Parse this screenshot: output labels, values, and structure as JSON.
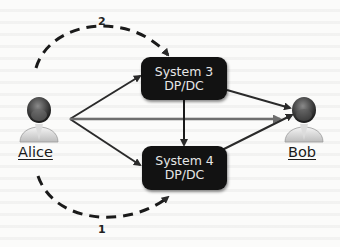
{
  "diagram": {
    "nodes": {
      "alice": {
        "label": "Alice",
        "icon": "user-avatar-icon"
      },
      "bob": {
        "label": "Bob",
        "icon": "user-avatar-icon"
      },
      "system3": {
        "line1": "System 3",
        "line2": "DP/DC"
      },
      "system4": {
        "line1": "System 4",
        "line2": "DP/DC"
      }
    },
    "paths": {
      "dashed_top_label": "2",
      "dashed_bottom_label": "1"
    },
    "edges": [
      {
        "from": "Alice",
        "to": "System 3",
        "style": "solid"
      },
      {
        "from": "Alice",
        "to": "System 4",
        "style": "solid"
      },
      {
        "from": "Alice",
        "to": "Bob",
        "style": "solid"
      },
      {
        "from": "System 3",
        "to": "System 4",
        "style": "solid"
      },
      {
        "from": "System 3",
        "to": "Bob",
        "style": "solid"
      },
      {
        "from": "System 4",
        "to": "Bob",
        "style": "solid"
      },
      {
        "from": "Alice",
        "to": "System 3",
        "style": "dashed",
        "label": "2"
      },
      {
        "from": "Alice",
        "to": "System 4",
        "style": "dashed",
        "label": "1"
      }
    ],
    "colors": {
      "box_fill": "#121212",
      "box_text": "#e6e6e6",
      "arrow_dark": "#2a2a2a",
      "arrow_gray": "#6e6e6e"
    }
  }
}
